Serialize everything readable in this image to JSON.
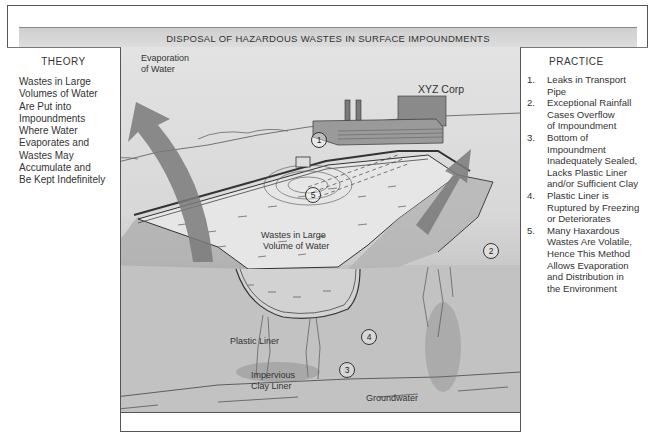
{
  "title": "DISPOSAL OF HAZARDOUS WASTES IN SURFACE IMPOUNDMENTS",
  "theory": {
    "heading": "THEORY",
    "lines": [
      "Wastes in Large",
      "Volumes of Water",
      "Are Put into",
      "Impoundments",
      "Where Water",
      "Evaporates and",
      "Wastes May",
      "Accumulate and",
      "Be Kept Indefinitely"
    ]
  },
  "practice": {
    "heading": "PRACTICE",
    "items": [
      {
        "num": "1.",
        "lines": [
          "Leaks in Transport",
          "Pipe"
        ]
      },
      {
        "num": "2.",
        "lines": [
          "Exceptional Rainfall",
          "Cases Overflow",
          "of Impoundment"
        ]
      },
      {
        "num": "3.",
        "lines": [
          "Bottom of",
          "Impoundment",
          "Inadequately Sealed,",
          "Lacks Plastic Liner",
          "and/or Sufficient Clay"
        ]
      },
      {
        "num": "4.",
        "lines": [
          "Plastic Liner is",
          "Ruptured by Freezing",
          "or Deteriorates"
        ]
      },
      {
        "num": "5.",
        "lines": [
          "Many Haxardous",
          "Wastes Are Volatile,",
          "Hence This Method",
          "Allows Evaporation",
          "and Distribution in",
          "the Environment"
        ]
      }
    ]
  },
  "illustration": {
    "labels": {
      "evaporation": [
        "Evaporation",
        "of Water"
      ],
      "company": "XYZ Corp",
      "wastes": [
        "Wastes in Large",
        "Volume of Water"
      ],
      "plastic_liner": "Plastic Liner",
      "clay_liner": [
        "Impervious",
        "Clay Liner"
      ],
      "groundwater": "Groundwater"
    },
    "markers": [
      "1",
      "2",
      "3",
      "4",
      "5"
    ]
  }
}
